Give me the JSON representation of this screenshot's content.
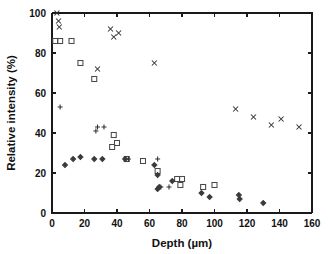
{
  "figure": {
    "background_color": "#ffffff",
    "axis_color": "#1a1a1a",
    "marker_color": "#3a3a3a"
  },
  "chart_data": {
    "type": "scatter",
    "title": "",
    "xlabel": "Depth (µm)",
    "ylabel": "Relative intensity (%)",
    "xlim": [
      0,
      160
    ],
    "ylim": [
      0,
      100
    ],
    "xticks": [
      0,
      20,
      40,
      60,
      80,
      100,
      120,
      140,
      160
    ],
    "yticks": [
      0,
      20,
      40,
      60,
      80,
      100
    ],
    "xtick_labels": [
      "0",
      "20",
      "40",
      "60",
      "80",
      "100",
      "120",
      "140",
      "160"
    ],
    "ytick_labels": [
      "0",
      "20",
      "40",
      "60",
      "80",
      "100"
    ],
    "grid": false,
    "legend": null,
    "legend_position": "none",
    "series": [
      {
        "name": "x-markers",
        "marker": "x",
        "points": [
          [
            3,
            100
          ],
          [
            4,
            96
          ],
          [
            4.5,
            93
          ],
          [
            36,
            92
          ],
          [
            38,
            88
          ],
          [
            41,
            90
          ],
          [
            28,
            72
          ],
          [
            63,
            75
          ],
          [
            113,
            52
          ],
          [
            124,
            48
          ],
          [
            135,
            44
          ],
          [
            141,
            47
          ],
          [
            152,
            43
          ]
        ]
      },
      {
        "name": "square-markers",
        "marker": "square",
        "points": [
          [
            2,
            86
          ],
          [
            5,
            86
          ],
          [
            12,
            86
          ],
          [
            17.5,
            75
          ],
          [
            26,
            67
          ],
          [
            38,
            39
          ],
          [
            37,
            33
          ],
          [
            40,
            35
          ],
          [
            46,
            27
          ],
          [
            56,
            26
          ],
          [
            65,
            21
          ],
          [
            77,
            17
          ],
          [
            80,
            17
          ],
          [
            79,
            14
          ],
          [
            93,
            13
          ],
          [
            100,
            14
          ]
        ]
      },
      {
        "name": "plus-markers",
        "marker": "plus",
        "points": [
          [
            5,
            53
          ],
          [
            28,
            43
          ],
          [
            32,
            43
          ],
          [
            27,
            41
          ],
          [
            47,
            27
          ],
          [
            65,
            27
          ],
          [
            72,
            13
          ],
          [
            67,
            13
          ]
        ]
      },
      {
        "name": "diamond-markers",
        "marker": "diamond",
        "points": [
          [
            8,
            24
          ],
          [
            13,
            27
          ],
          [
            17.5,
            28
          ],
          [
            26,
            27
          ],
          [
            31,
            27
          ],
          [
            45,
            27
          ],
          [
            63,
            24
          ],
          [
            65,
            19
          ],
          [
            66,
            13
          ],
          [
            65,
            12
          ],
          [
            74,
            16
          ],
          [
            92,
            10
          ],
          [
            97,
            8
          ],
          [
            115,
            9
          ],
          [
            115.5,
            7
          ],
          [
            130,
            5
          ]
        ]
      }
    ]
  }
}
